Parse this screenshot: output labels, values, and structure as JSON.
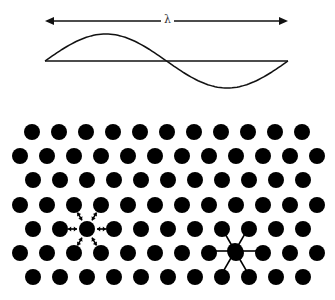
{
  "wave": {
    "label": "λ",
    "arrow_y": 21,
    "x_start": 45,
    "x_end": 288,
    "baseline_y": 61,
    "amplitude": 27
  },
  "lattice": {
    "dot_radius": 8,
    "dot_color": "#000000",
    "rows": [
      {
        "y": 132,
        "x0": 32,
        "count": 11
      },
      {
        "y": 156,
        "x0": 20,
        "count": 12
      },
      {
        "y": 180,
        "x0": 33,
        "count": 11
      },
      {
        "y": 205,
        "x0": 20,
        "count": 12
      },
      {
        "y": 229,
        "x0": 33,
        "count": 11
      },
      {
        "y": 253,
        "x0": 20,
        "count": 12
      },
      {
        "y": 277,
        "x0": 33,
        "count": 11
      }
    ],
    "spacing": 27,
    "vibrating_atom": {
      "x": 87,
      "y": 229,
      "description": "double-headed arrows to 6 neighbors"
    },
    "bonded_atom": {
      "x": 235,
      "y": 251,
      "description": "bond lines to 6 neighbors"
    }
  }
}
